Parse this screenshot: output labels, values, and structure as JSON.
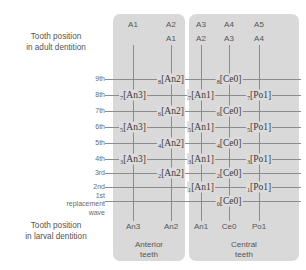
{
  "labels": {
    "adult": "Tooth position\nin adult dentition",
    "larval": "Tooth position\nin larval dentition"
  },
  "waves": [
    {
      "label": "9th",
      "y": 79
    },
    {
      "label": "8th",
      "y": 95
    },
    {
      "label": "7th",
      "y": 111
    },
    {
      "label": "6th",
      "y": 127
    },
    {
      "label": "5th",
      "y": 143
    },
    {
      "label": "4th",
      "y": 159
    },
    {
      "label": "3rd",
      "y": 173
    },
    {
      "label": "2nd",
      "y": 187
    },
    {
      "label": "1st\nreplacement wave",
      "y": 200
    }
  ],
  "groups": [
    {
      "name": "Anterior teeth",
      "foot": "Anterior\nteeth"
    },
    {
      "name": "Central teeth",
      "foot": "Central\nteeth"
    }
  ],
  "columns": [
    {
      "x": 133,
      "head1": "A1",
      "head2": "",
      "foot": "An3"
    },
    {
      "x": 171,
      "head1": "A2",
      "head2": "A1",
      "foot": "An2"
    },
    {
      "x": 201,
      "head1": "A3",
      "head2": "A2",
      "foot": "An1"
    },
    {
      "x": 229,
      "head1": "A4",
      "head2": "A3",
      "foot": "Ce0"
    },
    {
      "x": 259,
      "head1": "A5",
      "head2": "A4",
      "foot": "Po1"
    }
  ],
  "rows": [
    {
      "y": 79,
      "dotted_tail": false
    },
    {
      "y": 95,
      "dotted_tail": false
    },
    {
      "y": 111,
      "dotted_tail": false
    },
    {
      "y": 127,
      "dotted_tail": false
    },
    {
      "y": 143,
      "dotted_tail": false
    },
    {
      "y": 159,
      "dotted_tail": false
    },
    {
      "y": 173,
      "dotted_tail": false
    },
    {
      "y": 187,
      "dotted_tail": true
    },
    {
      "y": 201,
      "dotted_tail": true
    }
  ],
  "tokens": [
    {
      "sub": "8",
      "name": "An2",
      "x": 171,
      "y": 79
    },
    {
      "sub": "8",
      "name": "Ce0",
      "x": 229,
      "y": 79
    },
    {
      "sub": "7",
      "name": "An3",
      "x": 133,
      "y": 95
    },
    {
      "sub": "7",
      "name": "An1",
      "x": 201,
      "y": 95
    },
    {
      "sub": "7",
      "name": "Po1",
      "x": 259,
      "y": 95
    },
    {
      "sub": "6",
      "name": "An2",
      "x": 171,
      "y": 111
    },
    {
      "sub": "6",
      "name": "Ce0",
      "x": 229,
      "y": 111
    },
    {
      "sub": "5",
      "name": "An3",
      "x": 133,
      "y": 127
    },
    {
      "sub": "5",
      "name": "An1",
      "x": 201,
      "y": 127
    },
    {
      "sub": "5",
      "name": "Po1",
      "x": 259,
      "y": 127
    },
    {
      "sub": "4",
      "name": "An2",
      "x": 171,
      "y": 143
    },
    {
      "sub": "4",
      "name": "Ce0",
      "x": 229,
      "y": 143
    },
    {
      "sub": "3",
      "name": "An3",
      "x": 133,
      "y": 159
    },
    {
      "sub": "3",
      "name": "An1",
      "x": 201,
      "y": 159
    },
    {
      "sub": "3",
      "name": "Po1",
      "x": 259,
      "y": 159
    },
    {
      "sub": "2",
      "name": "An2",
      "x": 171,
      "y": 173
    },
    {
      "sub": "2",
      "name": "Ce0",
      "x": 229,
      "y": 173
    },
    {
      "sub": "1",
      "name": "An1",
      "x": 201,
      "y": 187
    },
    {
      "sub": "1",
      "name": "Po1",
      "x": 259,
      "y": 187
    },
    {
      "sub": "0",
      "name": "Ce0",
      "x": 229,
      "y": 201
    }
  ],
  "colors": {
    "panel": "#d9d9d9",
    "line": "#8c8c8c",
    "text": "#555555",
    "token_text": "#3a3a3a"
  }
}
